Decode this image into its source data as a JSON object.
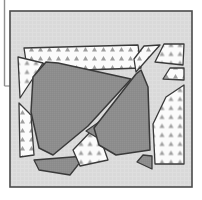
{
  "figure": {
    "title": "Abstract polygon partition diagram",
    "description": "A bordered rectangular panel containing a set of irregular polygons separated by white channels. Polygons are filled either with a solid medium-gray tone or a white triangle-stipple pattern.",
    "canvas": {
      "width": 202,
      "height": 200
    },
    "colors": {
      "page_background": "#ffffff",
      "panel_background": "#d9d9d9",
      "panel_border": "#4a4a4a",
      "solid_fill": "#8d8d8d",
      "pattern_background": "#fbfbfb",
      "pattern_mark": "#9a9a9a",
      "polygon_outline": "#3a3a3a",
      "gap_color": "#f2f2f2",
      "rule_color": "#8e8e8e"
    },
    "panel": {
      "name": "panel-frame",
      "x": 10,
      "y": 11,
      "width": 182,
      "height": 176,
      "border_width": 1.6
    },
    "left_rule": {
      "name": "left-vertical-rule",
      "x": 4.5,
      "y_top": 0,
      "y_bottom": 86,
      "stroke_width": 1.4,
      "foot_x_end": 13,
      "foot_y": 86
    },
    "legend": {
      "solid_label": "solid gray region",
      "pattern_label": "stippled region",
      "background_label": "background"
    },
    "polygons": [
      {
        "id": "p1",
        "name": "top-left-banner-strip",
        "fill": "pattern",
        "points": "24,48 138,45 141,68 83,70 26,61"
      },
      {
        "id": "p2",
        "name": "left-upper-wedge",
        "fill": "pattern",
        "points": "18,57 43,63 20,98"
      },
      {
        "id": "p3",
        "name": "left-lower-sliver",
        "fill": "pattern",
        "points": "19,103 31,115 34,155 20,157"
      },
      {
        "id": "p4",
        "name": "central-large-polygon",
        "fill": "solid",
        "points": "46,62 58,63 131,79 88,126 53,155 39,148 31,112 33,77"
      },
      {
        "id": "p5",
        "name": "central-lower-dark-triangle",
        "fill": "solid",
        "points": "34,160 85,156 70,175 39,170"
      },
      {
        "id": "p6",
        "name": "central-bottom-stipple-polygon",
        "fill": "pattern",
        "points": "73,150 96,126 102,143 108,160 80,166"
      },
      {
        "id": "p7",
        "name": "center-small-triangle-gap",
        "fill": "solid",
        "points": "86,131 99,122 101,140"
      },
      {
        "id": "p8",
        "name": "right-center-solid-polygon",
        "fill": "solid",
        "points": "136,74 141,70 148,87 150,150 116,155 99,145 94,128"
      },
      {
        "id": "p9",
        "name": "right-upper-stipple-slab",
        "fill": "pattern",
        "points": "144,46 160,45 136,72 134,59"
      },
      {
        "id": "p10",
        "name": "top-right-corner-triangle",
        "fill": "pattern",
        "points": "164,44 184,44 183,65 155,62"
      },
      {
        "id": "p11",
        "name": "right-narrow-stipple-band",
        "fill": "pattern",
        "points": "170,68 184,68 184,80 163,79"
      },
      {
        "id": "p12",
        "name": "right-large-stipple-region",
        "fill": "pattern",
        "points": "184,85 184,164 155,164 153,124 166,97"
      },
      {
        "id": "p13",
        "name": "right-lower-solid-wedge",
        "fill": "solid",
        "points": "143,155 152,156 152,169 137,162"
      }
    ]
  }
}
